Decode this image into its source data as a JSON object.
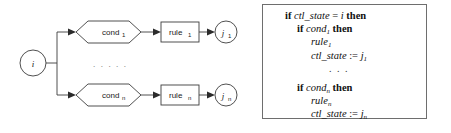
{
  "figure": {
    "type": "control-flow-diagram-with-code",
    "background_color": "#ffffff",
    "line_color": "#3c3c3c",
    "text_color": "#111111",
    "box_border_color": "#6e6e6e"
  },
  "flowchart": {
    "start_node": {
      "label": "i"
    },
    "ellipsis": ". . . . .",
    "branches": [
      {
        "condition": {
          "label": "cond",
          "subscript": "1"
        },
        "rule": {
          "label": "rule",
          "subscript": "1"
        },
        "target": {
          "label": "j",
          "subscript": "1"
        }
      },
      {
        "condition": {
          "label": "cond",
          "subscript": "n"
        },
        "rule": {
          "label": "rule",
          "subscript": "n"
        },
        "target": {
          "label": "j",
          "subscript": "n"
        }
      }
    ]
  },
  "code_box": {
    "lines": [
      {
        "indent": "ind0",
        "parts": [
          {
            "text": "if ",
            "style": "kw"
          },
          {
            "text": "ctl_state",
            "style": "it"
          },
          {
            "text": " = ",
            "style": "plain"
          },
          {
            "text": "i",
            "style": "it"
          },
          {
            "text": " then",
            "style": "kw"
          }
        ]
      },
      {
        "indent": "ind1",
        "parts": [
          {
            "text": "if ",
            "style": "kw"
          },
          {
            "text": "cond",
            "style": "it"
          },
          {
            "text": "1",
            "style": "sub"
          },
          {
            "text": " then",
            "style": "kw"
          }
        ]
      },
      {
        "indent": "ind2",
        "parts": [
          {
            "text": "rule",
            "style": "it"
          },
          {
            "text": "1",
            "style": "sub"
          }
        ]
      },
      {
        "indent": "ind2",
        "parts": [
          {
            "text": "ctl_state",
            "style": "it"
          },
          {
            "text": " := ",
            "style": "plain"
          },
          {
            "text": "j",
            "style": "it"
          },
          {
            "text": "1",
            "style": "sub"
          }
        ]
      },
      {
        "indent": "ind-dots",
        "parts": [
          {
            "text": ". . .",
            "style": "dots"
          }
        ]
      },
      {
        "indent": "ind1",
        "spacer_above": true,
        "parts": [
          {
            "text": "if ",
            "style": "kw"
          },
          {
            "text": "cond",
            "style": "it"
          },
          {
            "text": "n",
            "style": "sub"
          },
          {
            "text": " then",
            "style": "kw"
          }
        ]
      },
      {
        "indent": "ind2",
        "parts": [
          {
            "text": "rule",
            "style": "it"
          },
          {
            "text": "n",
            "style": "sub"
          }
        ]
      },
      {
        "indent": "ind2",
        "parts": [
          {
            "text": "ctl_state",
            "style": "it"
          },
          {
            "text": " := ",
            "style": "plain"
          },
          {
            "text": "j",
            "style": "it"
          },
          {
            "text": "n",
            "style": "sub"
          }
        ]
      }
    ]
  }
}
